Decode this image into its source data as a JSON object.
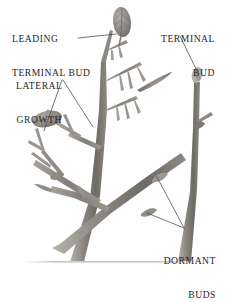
{
  "figure": {
    "background_color": "#fefefe",
    "ink_color": "#27262a",
    "branch_color": "#8a8680",
    "branch_shadow_color": "#6f6b66",
    "branch_highlight_color": "#b9b5ae",
    "leader_line_color": "#4a4a4a",
    "ground_line_color": "#c9c6c1"
  },
  "labels": {
    "leading_terminal_bud": {
      "line1": "LEADING",
      "line2": "TERMINAL BUD"
    },
    "lateral_growth": {
      "line1": "LATERAL",
      "line2": "GROWTH"
    },
    "terminal_bud": {
      "line1": "TERMINAL",
      "line2": "BUD"
    },
    "dormant_buds": {
      "line1": "DORMANT",
      "line2": "BUDS"
    }
  },
  "annotations": [
    {
      "name": "leading-terminal-bud",
      "target_x": 122,
      "target_y": 30
    },
    {
      "name": "lateral-growth-left",
      "target_x": 47,
      "target_y": 120
    },
    {
      "name": "lateral-growth-right",
      "target_x": 93,
      "target_y": 122
    },
    {
      "name": "terminal-bud",
      "target_x": 197,
      "target_y": 73
    },
    {
      "name": "dormant-bud-upper",
      "target_x": 157,
      "target_y": 176
    },
    {
      "name": "dormant-bud-lower",
      "target_x": 147,
      "target_y": 212
    }
  ]
}
